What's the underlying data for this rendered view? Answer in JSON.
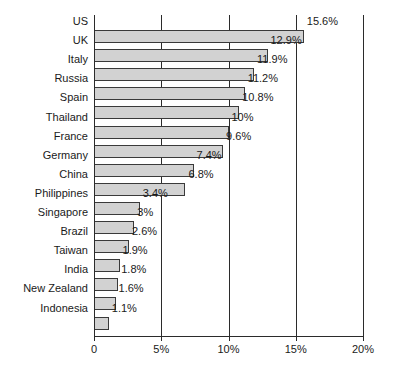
{
  "chart_data": {
    "type": "bar",
    "orientation": "horizontal",
    "title": "",
    "xlabel": "",
    "ylabel": "",
    "xlim": [
      0,
      20
    ],
    "grid": true,
    "legend": null,
    "tick_labels": [
      "0",
      "5%",
      "10%",
      "15%",
      "20%"
    ],
    "tick_values": [
      0,
      5,
      10,
      15,
      20
    ],
    "categories": [
      "US",
      "UK",
      "Italy",
      "Russia",
      "Spain",
      "Thailand",
      "France",
      "Germany",
      "China",
      "Philippines",
      "Singapore",
      "Brazil",
      "Taiwan",
      "India",
      "New Zealand",
      "Indonesia"
    ],
    "values": [
      15.6,
      12.9,
      11.9,
      11.2,
      10.8,
      10,
      9.6,
      7.4,
      6.8,
      3.4,
      3,
      2.6,
      1.9,
      1.8,
      1.6,
      1.1
    ],
    "value_labels": [
      "15.6%",
      "12.9%",
      "11.9%",
      "11.2%",
      "10.8%",
      "10%",
      "9.6%",
      "7.4%",
      "6.8%",
      "3.4%",
      "3%",
      "2.6%",
      "1.9%",
      "1.8%",
      "1.6%",
      "1.1%"
    ],
    "colors": {
      "bar_fill": "#d2d2d2",
      "bar_border": "#3a3a3a",
      "axis": "#2b2b2b",
      "text": "#1a1a1a",
      "background": "#ffffff"
    }
  }
}
